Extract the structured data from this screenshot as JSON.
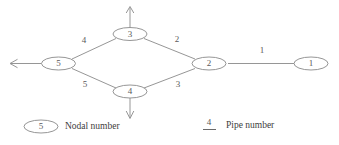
{
  "diagram": {
    "colors": {
      "background": "#ffffff",
      "line": "#8a8a8a",
      "text": "#5a5a5a",
      "legend_text": "#3d3d3d"
    },
    "nodes": [
      {
        "id": "node-1",
        "label": "1",
        "cx": 311,
        "cy": 63.5,
        "rx": 17,
        "ry": 6.5
      },
      {
        "id": "node-2",
        "label": "2",
        "cx": 209,
        "cy": 63.5,
        "rx": 17,
        "ry": 6.5
      },
      {
        "id": "node-3",
        "label": "3",
        "cx": 130,
        "cy": 34,
        "rx": 17,
        "ry": 6.5
      },
      {
        "id": "node-4",
        "label": "4",
        "cx": 130,
        "cy": 91.5,
        "rx": 17,
        "ry": 6.5
      },
      {
        "id": "node-5",
        "label": "5",
        "cx": 58.5,
        "cy": 63.5,
        "rx": 17,
        "ry": 6.5
      }
    ],
    "pipes": [
      {
        "id": "pipe-1",
        "label": "1",
        "from": "node-2",
        "to": "node-1",
        "label_x": 262,
        "label_y": 51
      },
      {
        "id": "pipe-2",
        "label": "2",
        "from": "node-3",
        "to": "node-2",
        "label_x": 177,
        "label_y": 40
      },
      {
        "id": "pipe-3",
        "label": "3",
        "from": "node-4",
        "to": "node-2",
        "label_x": 178,
        "label_y": 85
      },
      {
        "id": "pipe-4",
        "label": "4",
        "from": "node-5",
        "to": "node-3",
        "label_x": 84,
        "label_y": 41
      },
      {
        "id": "pipe-5",
        "label": "5",
        "from": "node-5",
        "to": "node-4",
        "label_x": 85,
        "label_y": 85
      }
    ],
    "flow_arrows": [
      {
        "id": "arrow-node-3-up",
        "direction": "up",
        "from_node": "node-3"
      },
      {
        "id": "arrow-node-4-down",
        "direction": "down",
        "from_node": "node-4"
      },
      {
        "id": "arrow-node-5-left",
        "direction": "left",
        "from_node": "node-5"
      }
    ]
  },
  "legend": {
    "nodal": {
      "symbol_label": "5",
      "text": "Nodal number"
    },
    "pipe": {
      "symbol_label": "4",
      "text": "Pipe number"
    }
  }
}
